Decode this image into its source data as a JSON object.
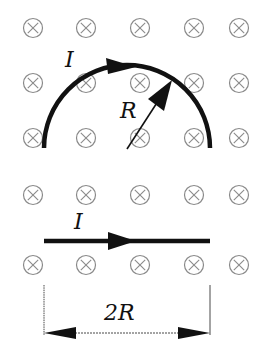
{
  "diagram": {
    "field": {
      "symbol": "⊗",
      "meaning": "magnetic field into the page",
      "color": "#888888",
      "columns_x": [
        33,
        86,
        140,
        194,
        239
      ],
      "rows_y": [
        28,
        83,
        138,
        195,
        265
      ]
    },
    "semicircle": {
      "current_label": "I",
      "radius_label": "R",
      "center": [
        127,
        148
      ],
      "radius": 83
    },
    "straight_wire": {
      "current_label": "I",
      "y": 241,
      "x_start": 44,
      "x_end": 210
    },
    "dimension": {
      "label": "2R",
      "y": 333
    },
    "colors": {
      "wire": "#111111",
      "field_symbol": "#8a8a8a",
      "background": "#ffffff"
    }
  }
}
